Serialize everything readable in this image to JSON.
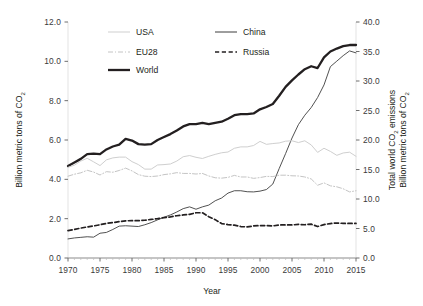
{
  "chart_data": {
    "type": "line",
    "title": "",
    "xlabel": "Year",
    "ylabel_left": "Billion metric tons of CO2",
    "ylabel_right_line1": "Total world CO2 emissions",
    "ylabel_right_line2": "Billion metric tons of CO2",
    "xlim": [
      1970,
      2015
    ],
    "ylim_left": [
      0.0,
      12.0
    ],
    "ylim_right": [
      0.0,
      40.0
    ],
    "xticks": [
      1970,
      1975,
      1980,
      1985,
      1990,
      1995,
      2000,
      2005,
      2010,
      2015
    ],
    "xtick_labels": [
      "1970",
      "1975",
      "1980",
      "1985",
      "1990",
      "1995",
      "2000",
      "2005",
      "2010",
      "2015"
    ],
    "yticks_left": [
      0.0,
      2.0,
      4.0,
      6.0,
      8.0,
      10.0,
      12.0
    ],
    "ytick_labels_left": [
      "0.0",
      "2.0",
      "4.0",
      "6.0",
      "8.0",
      "10.0",
      "12.0"
    ],
    "yticks_right": [
      0.0,
      5.0,
      10.0,
      15.0,
      20.0,
      25.0,
      30.0,
      35.0,
      40.0
    ],
    "ytick_labels_right": [
      "0.0",
      "5.0",
      "10.0",
      "15.0",
      "20.0",
      "25.0",
      "30.0",
      "35.0",
      "40.0"
    ],
    "grid": false,
    "legend_position": "top-center",
    "x": [
      1970,
      1971,
      1972,
      1973,
      1974,
      1975,
      1976,
      1977,
      1978,
      1979,
      1980,
      1981,
      1982,
      1983,
      1984,
      1985,
      1986,
      1987,
      1988,
      1989,
      1990,
      1991,
      1992,
      1993,
      1994,
      1995,
      1996,
      1997,
      1998,
      1999,
      2000,
      2001,
      2002,
      2003,
      2004,
      2005,
      2006,
      2007,
      2008,
      2009,
      2010,
      2011,
      2012,
      2013,
      2014,
      2015
    ],
    "series": [
      {
        "name": "World",
        "axis": "right",
        "unit": "Billion metric tons of CO2",
        "color": "#231f20",
        "style": "solid",
        "width": 2.3,
        "values": [
          15.6,
          16.2,
          16.8,
          17.6,
          17.7,
          17.6,
          18.4,
          18.9,
          19.2,
          20.2,
          19.9,
          19.3,
          19.2,
          19.3,
          20.0,
          20.5,
          21.0,
          21.6,
          22.3,
          22.7,
          22.7,
          22.9,
          22.7,
          22.9,
          23.1,
          23.6,
          24.2,
          24.4,
          24.4,
          24.5,
          25.2,
          25.6,
          26.1,
          27.5,
          29.0,
          30.1,
          31.1,
          32.0,
          32.5,
          32.2,
          34.0,
          35.0,
          35.5,
          35.9,
          36.1,
          36.1
        ]
      },
      {
        "name": "China",
        "axis": "left",
        "unit": "Billion metric tons of CO2",
        "color": "#3d3d3d",
        "style": "solid",
        "width": 0.9,
        "values": [
          0.97,
          1.02,
          1.05,
          1.08,
          1.06,
          1.26,
          1.3,
          1.45,
          1.62,
          1.64,
          1.62,
          1.6,
          1.69,
          1.8,
          1.94,
          2.07,
          2.19,
          2.34,
          2.51,
          2.6,
          2.48,
          2.6,
          2.69,
          2.91,
          3.05,
          3.3,
          3.42,
          3.42,
          3.37,
          3.36,
          3.4,
          3.48,
          3.76,
          4.55,
          5.31,
          6.1,
          6.78,
          7.26,
          7.65,
          8.16,
          8.8,
          9.73,
          10.01,
          10.29,
          10.53,
          10.43
        ]
      },
      {
        "name": "USA",
        "axis": "left",
        "unit": "Billion metric tons of CO2",
        "color": "#cfcfcf",
        "style": "solid",
        "width": 1.0,
        "values": [
          4.61,
          4.72,
          4.93,
          5.07,
          4.89,
          4.7,
          4.99,
          5.09,
          5.13,
          5.13,
          4.9,
          4.75,
          4.52,
          4.52,
          4.73,
          4.75,
          4.78,
          4.93,
          5.15,
          5.21,
          5.12,
          5.06,
          5.17,
          5.27,
          5.35,
          5.39,
          5.58,
          5.65,
          5.65,
          5.72,
          5.93,
          5.78,
          5.82,
          5.85,
          5.94,
          5.96,
          5.87,
          5.96,
          5.75,
          5.37,
          5.58,
          5.42,
          5.22,
          5.34,
          5.38,
          5.17
        ]
      },
      {
        "name": "EU28",
        "axis": "left",
        "unit": "Billion metric tons of CO2",
        "color": "#c4c4c4",
        "style": "dashdot",
        "width": 1.0,
        "values": [
          4.16,
          4.26,
          4.33,
          4.46,
          4.37,
          4.22,
          4.39,
          4.36,
          4.45,
          4.57,
          4.43,
          4.24,
          4.16,
          4.14,
          4.17,
          4.24,
          4.28,
          4.34,
          4.3,
          4.3,
          4.27,
          4.3,
          4.17,
          4.08,
          4.06,
          4.1,
          4.2,
          4.12,
          4.12,
          4.05,
          4.09,
          4.15,
          4.14,
          4.21,
          4.21,
          4.18,
          4.17,
          4.12,
          4.02,
          3.7,
          3.82,
          3.67,
          3.62,
          3.52,
          3.36,
          3.42
        ]
      },
      {
        "name": "Russia",
        "axis": "left",
        "unit": "Billion metric tons of CO2",
        "color": "#231f20",
        "style": "dashed",
        "width": 1.7,
        "values": [
          1.39,
          1.45,
          1.52,
          1.58,
          1.63,
          1.69,
          1.76,
          1.8,
          1.85,
          1.89,
          1.9,
          1.9,
          1.92,
          1.96,
          2.0,
          2.05,
          2.09,
          2.15,
          2.19,
          2.22,
          2.3,
          2.3,
          2.1,
          1.95,
          1.75,
          1.7,
          1.67,
          1.6,
          1.58,
          1.63,
          1.65,
          1.65,
          1.63,
          1.68,
          1.68,
          1.68,
          1.71,
          1.69,
          1.72,
          1.6,
          1.7,
          1.75,
          1.78,
          1.76,
          1.76,
          1.76
        ]
      }
    ]
  },
  "legend": {
    "items": [
      {
        "label": "USA",
        "style": "solid",
        "color": "#cfcfcf",
        "width": 1.0
      },
      {
        "label": "China",
        "style": "solid",
        "color": "#3d3d3d",
        "width": 1.0
      },
      {
        "label": "EU28",
        "style": "dashdot",
        "color": "#c4c4c4",
        "width": 1.0
      },
      {
        "label": "Russia",
        "style": "dashed",
        "color": "#231f20",
        "width": 1.7
      },
      {
        "label": "World",
        "style": "solid",
        "color": "#231f20",
        "width": 2.3
      }
    ]
  },
  "axes": {
    "x_title": "Year",
    "left_title_pre": "Billion metric tons of CO",
    "left_title_sub": "2",
    "right_title_line1_pre": "Total world CO",
    "right_title_line1_sub": "2",
    "right_title_line1_post": " emissions",
    "right_title_line2_pre": "Billion metric tons of CO",
    "right_title_line2_sub": "2"
  }
}
